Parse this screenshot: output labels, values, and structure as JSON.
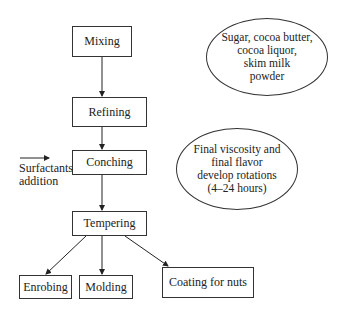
{
  "nodes": {
    "mixing": "Mixing",
    "refining": "Refining",
    "conching": "Conching",
    "tempering": "Tempering",
    "enrobing": "Enrobing",
    "molding": "Molding",
    "coating": "Coating for nuts"
  },
  "notes": {
    "ingredients": [
      "Sugar, cocoa butter,",
      "cocoa liquor,",
      "skim milk",
      "powder"
    ],
    "conching_note": [
      "Final viscosity and",
      "final flavor",
      "develop rotations",
      "(4–24 hours)"
    ]
  },
  "side_input": {
    "line1": "Surfactants",
    "line2": "addition"
  }
}
